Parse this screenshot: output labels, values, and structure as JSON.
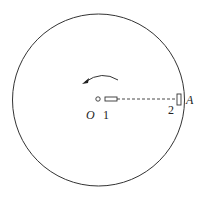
{
  "diagram": {
    "type": "rotating-disk",
    "rotation_direction": "counterclockwise",
    "labels": {
      "center": "O",
      "block1": "1",
      "block2": "2",
      "point": "A"
    },
    "colors": {
      "stroke": "#333333",
      "background": "#ffffff"
    }
  }
}
